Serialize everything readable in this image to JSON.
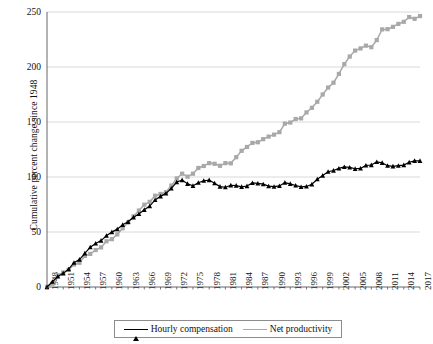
{
  "chart_data": {
    "type": "line",
    "title": "",
    "xlabel": "",
    "ylabel": "Cumulative percent change since 1948",
    "xlim": [
      1948,
      2017
    ],
    "ylim": [
      0,
      250
    ],
    "ytick_values": [
      0,
      50,
      100,
      150,
      200,
      250
    ],
    "ytick_labels": [
      "0",
      "50",
      "100",
      "150",
      "200",
      "250"
    ],
    "xtick_values": [
      1948,
      1951,
      1954,
      1957,
      1960,
      1963,
      1966,
      1969,
      1972,
      1975,
      1978,
      1981,
      1984,
      1987,
      1990,
      1993,
      1996,
      1999,
      2002,
      2005,
      2008,
      2011,
      2014,
      2017
    ],
    "xtick_labels": [
      "1948",
      "1951",
      "1954",
      "1957",
      "1960",
      "1963",
      "1966",
      "1969",
      "1972",
      "1975",
      "1978",
      "1981",
      "1984",
      "1987",
      "1990",
      "1993",
      "1996",
      "1999",
      "2002",
      "2005",
      "2008",
      "2011",
      "2014",
      "2017"
    ],
    "grid": "horizontal",
    "legend_position": "bottom",
    "x": [
      1948,
      1949,
      1950,
      1951,
      1952,
      1953,
      1954,
      1955,
      1956,
      1957,
      1958,
      1959,
      1960,
      1961,
      1962,
      1963,
      1964,
      1965,
      1966,
      1967,
      1968,
      1969,
      1970,
      1971,
      1972,
      1973,
      1974,
      1975,
      1976,
      1977,
      1978,
      1979,
      1980,
      1981,
      1982,
      1983,
      1984,
      1985,
      1986,
      1987,
      1988,
      1989,
      1990,
      1991,
      1992,
      1993,
      1994,
      1995,
      1996,
      1997,
      1998,
      1999,
      2000,
      2001,
      2002,
      2003,
      2004,
      2005,
      2006,
      2007,
      2008,
      2009,
      2010,
      2011,
      2012,
      2013,
      2014,
      2015,
      2016,
      2017
    ],
    "series": [
      {
        "name": "Hourly compensation",
        "color": "#000000",
        "marker": "triangle",
        "values": [
          0,
          4.8,
          9.6,
          12.4,
          16.2,
          22.1,
          24.9,
          30.6,
          36.2,
          39.6,
          42.2,
          46.6,
          49.9,
          52.6,
          56.5,
          59.3,
          63.4,
          66.4,
          70.2,
          73.6,
          79.2,
          82.4,
          85.1,
          89.6,
          95.4,
          97.2,
          93.8,
          92.0,
          94.8,
          96.6,
          97.2,
          94.4,
          91.3,
          90.7,
          92.5,
          92.2,
          91.1,
          91.8,
          94.6,
          94.2,
          93.5,
          91.7,
          91.2,
          91.9,
          94.9,
          93.8,
          92.3,
          91.0,
          91.4,
          93.4,
          98.0,
          101.3,
          104.8,
          105.9,
          107.8,
          109.2,
          108.7,
          107.5,
          107.8,
          110.5,
          110.9,
          113.7,
          112.9,
          110.3,
          109.7,
          110.3,
          110.8,
          113.4,
          114.7,
          114.7
        ]
      },
      {
        "name": "Net productivity",
        "color": "#a8a8a8",
        "marker": "square",
        "values": [
          0,
          3.0,
          10.6,
          13.2,
          15.6,
          20.4,
          22.0,
          28.3,
          30.1,
          33.6,
          36.0,
          41.6,
          43.5,
          47.8,
          53.4,
          58.6,
          64.2,
          69.5,
          74.8,
          77.4,
          83.0,
          84.6,
          86.2,
          92.2,
          98.7,
          103.0,
          100.3,
          103.0,
          108.2,
          110.0,
          112.6,
          112.0,
          110.2,
          112.6,
          112.4,
          118.0,
          123.8,
          127.3,
          131.0,
          131.6,
          134.4,
          136.7,
          138.5,
          140.8,
          148.5,
          149.5,
          152.7,
          153.3,
          158.7,
          162.9,
          168.4,
          175.0,
          181.3,
          185.7,
          193.7,
          202.6,
          209.5,
          214.9,
          216.9,
          219.4,
          218.0,
          224.5,
          234.2,
          234.4,
          236.5,
          239.2,
          241.1,
          245.4,
          243.8,
          246.3
        ]
      }
    ]
  },
  "legend": {
    "items": [
      {
        "label": "Hourly compensation"
      },
      {
        "label": "Net productivity"
      }
    ]
  }
}
